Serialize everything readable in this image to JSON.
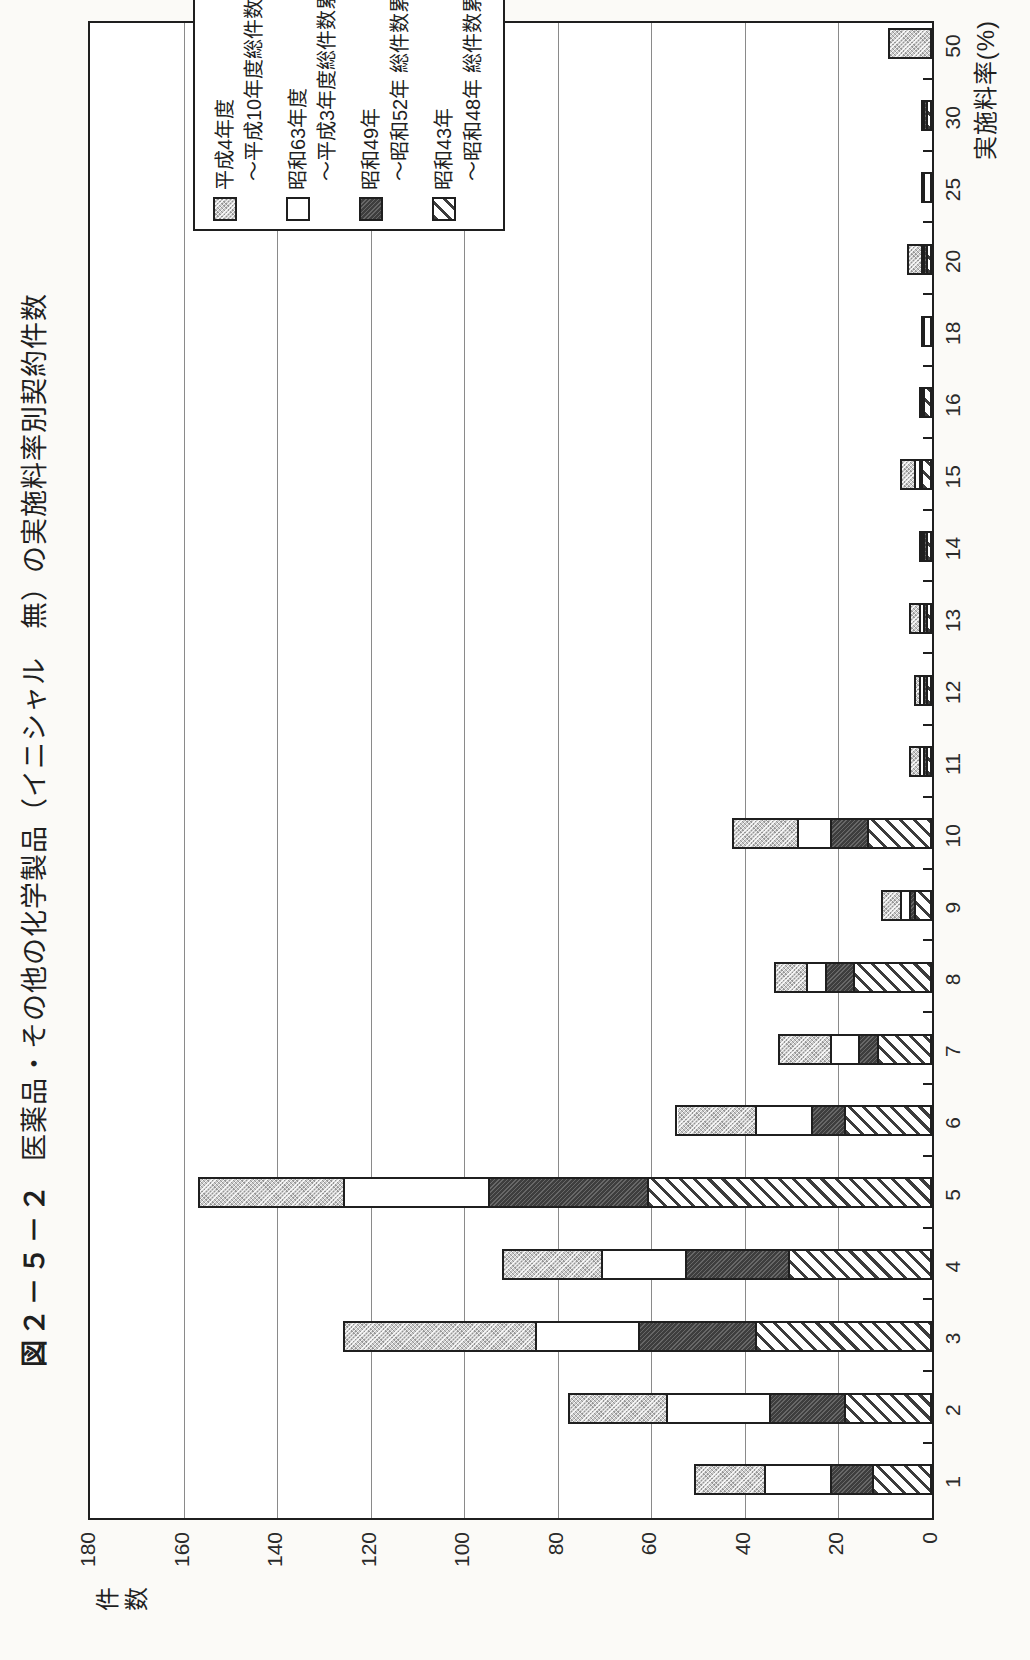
{
  "header": {
    "figure_label": "図２－５－２",
    "title": "医薬品・その他の化学製品（イニシャル　無）の実施料率別契約件数"
  },
  "y_axis": {
    "unit_label": "件数",
    "ticks": [
      180,
      160,
      140,
      120,
      100,
      80,
      60,
      40,
      20,
      0
    ]
  },
  "x_axis": {
    "label": "実施料率(%)"
  },
  "legend": {
    "entries": [
      {
        "line1": "平成4年度",
        "line2": "～平成10年度総件数累計",
        "pattern": "light"
      },
      {
        "line1": "昭和63年度",
        "line2": "～平成3年度総件数累計",
        "pattern": "white"
      },
      {
        "line1": "昭和49年",
        "line2": "～昭和52年 総件数累計",
        "pattern": "dark"
      },
      {
        "line1": "昭和43年",
        "line2": "～昭和48年 総件数累計",
        "pattern": "hatch"
      }
    ]
  },
  "colors": {
    "light_gray_fill": "#cbcbcb",
    "dark_gray_fill": "#3e3e3e",
    "white_fill": "#ffffff",
    "line_color": "#1f1f1f"
  },
  "chart_data": {
    "type": "bar",
    "stacked": true,
    "orientation_note": "landscape column chart printed rotated 90deg counterclockwise on portrait page",
    "xlabel": "実施料率(%)",
    "ylabel": "件数",
    "ylim": [
      0,
      180
    ],
    "ytick_step": 20,
    "grid": true,
    "legend_position": "top-right",
    "categories": [
      "1",
      "2",
      "3",
      "4",
      "5",
      "6",
      "7",
      "8",
      "9",
      "10",
      "11",
      "12",
      "13",
      "14",
      "15",
      "16",
      "18",
      "20",
      "25",
      "30",
      "50"
    ],
    "series": [
      {
        "name": "昭和43年～昭和48年 総件数累計",
        "pattern": "hatch",
        "values": [
          12,
          18,
          37,
          30,
          60,
          18,
          11,
          16,
          3,
          13,
          0.5,
          0.5,
          0.5,
          0.5,
          1.5,
          1,
          0,
          0.5,
          0,
          0.5,
          0
        ]
      },
      {
        "name": "昭和49年～昭和52年 総件数累計",
        "pattern": "dark",
        "values": [
          9,
          16,
          25,
          22,
          34,
          7,
          4,
          6,
          1,
          8,
          0.5,
          0.5,
          0.5,
          0.5,
          0.5,
          0.5,
          0,
          0.5,
          0,
          0.5,
          0
        ]
      },
      {
        "name": "昭和63年度～平成3年度総件数累計",
        "pattern": "white",
        "values": [
          14,
          22,
          22,
          18,
          31,
          12,
          6,
          4,
          2,
          7,
          1,
          1,
          1,
          0.5,
          1,
          0.5,
          1,
          0.5,
          1,
          0.5,
          0
        ]
      },
      {
        "name": "平成4年度～平成10年度総件数累計",
        "pattern": "light",
        "values": [
          15,
          21,
          41,
          21,
          31,
          17,
          11,
          7,
          4,
          14,
          2,
          1,
          2,
          0.5,
          3,
          0,
          0.5,
          3,
          0.5,
          0,
          8.5
        ]
      }
    ]
  }
}
